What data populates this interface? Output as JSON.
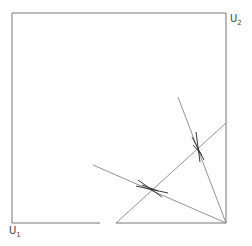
{
  "diagram": {
    "labels": {
      "u1": "U",
      "u1_sub": "1",
      "u2": "U",
      "u2_sub": "2"
    },
    "colors": {
      "line": "#555555",
      "mark": "#222222"
    },
    "box": {
      "x1": 12,
      "y1": 13,
      "x2": 226,
      "y2": 223
    },
    "bottom_gap": [
      100,
      116
    ],
    "lines": [
      {
        "name": "diagonal",
        "from": [
          116,
          223
        ],
        "to": [
          226,
          123
        ]
      },
      {
        "name": "ray-shallow",
        "from": [
          93,
          165
        ],
        "to": [
          226,
          223
        ]
      },
      {
        "name": "ray-steep",
        "from": [
          178,
          97
        ],
        "to": [
          226,
          223
        ]
      }
    ],
    "intersections": [
      {
        "name": "cross-lower",
        "at": [
          150,
          188
        ]
      },
      {
        "name": "cross-upper",
        "at": [
          198,
          150
        ]
      }
    ]
  }
}
